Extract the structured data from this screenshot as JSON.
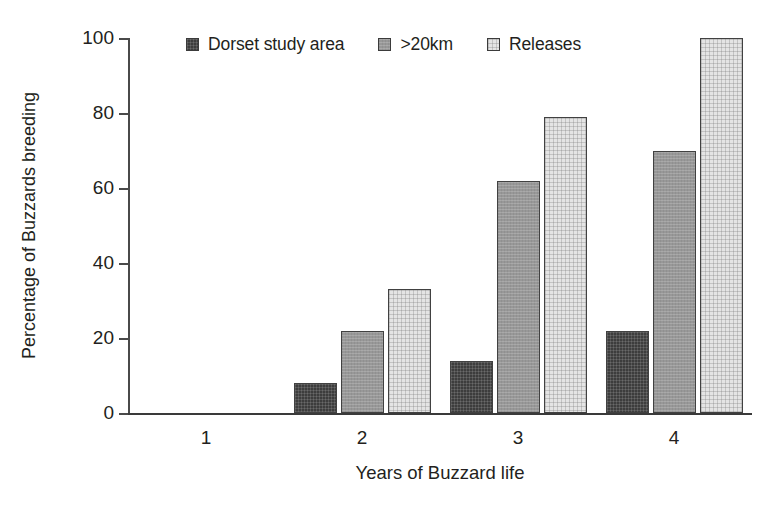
{
  "chart_data": {
    "type": "bar",
    "title": "",
    "xlabel": "Years of Buzzard life",
    "ylabel": "Percentage of Buzzards breeding",
    "categories": [
      "1",
      "2",
      "3",
      "4"
    ],
    "series": [
      {
        "name": "Dorset study area",
        "values": [
          0,
          8,
          14,
          22
        ],
        "color": "#3d3d3d"
      },
      {
        "name": ">20km",
        "values": [
          0,
          22,
          62,
          70
        ],
        "color": "#989898"
      },
      {
        "name": "Releases",
        "values": [
          0,
          33,
          79,
          100
        ],
        "color": "#e4e4e4"
      }
    ],
    "ylim": [
      0,
      100
    ],
    "yticks": [
      0,
      20,
      40,
      60,
      80,
      100
    ],
    "grid": false,
    "legend_position": "top-center"
  }
}
